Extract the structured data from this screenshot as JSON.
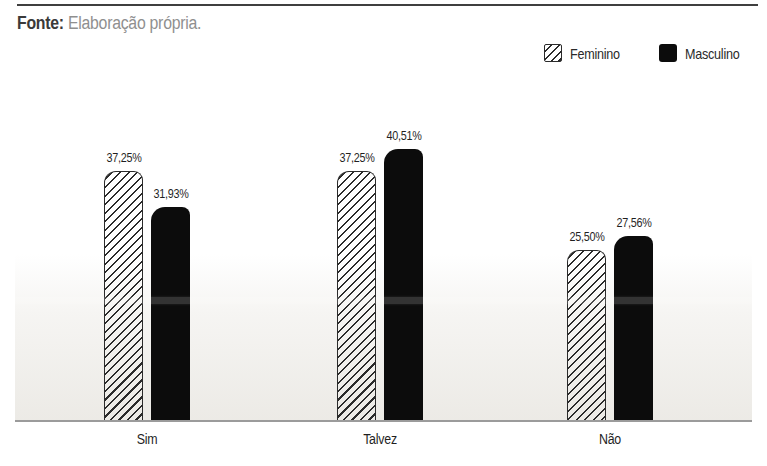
{
  "source_note": {
    "label": "Fonte:",
    "text": "Elaboração própria."
  },
  "legend": {
    "position": "top-right",
    "items": [
      {
        "label": "Feminino",
        "swatch": "hatched-square-icon"
      },
      {
        "label": "Masculino",
        "swatch": "solid-square-icon"
      }
    ]
  },
  "chart_data": {
    "type": "bar",
    "title": "",
    "xlabel": "",
    "ylabel": "",
    "categories": [
      "Sim",
      "Talvez",
      "Não"
    ],
    "series": [
      {
        "name": "Feminino",
        "style": "hatched",
        "values": [
          37.25,
          37.25,
          25.5
        ],
        "value_labels": [
          "37,25%",
          "37,25%",
          "25,50%"
        ]
      },
      {
        "name": "Masculino",
        "style": "solid",
        "values": [
          31.93,
          40.51,
          27.56
        ],
        "value_labels": [
          "31,93%",
          "40,51%",
          "27,56%"
        ]
      }
    ],
    "unit": "%",
    "decimal_separator": ",",
    "ylim": [
      0,
      45
    ],
    "grid": false,
    "y_axis_visible": false,
    "value_labels_shown": true,
    "legend_position": "top-right"
  },
  "colors": {
    "bar_solid": "#0c0c0c",
    "hatch_line": "#2b2b2b",
    "baseline": "#9b9b9b",
    "top_rule": "#3f3f3f",
    "source_label_text": "#3a3a3a",
    "source_body_text": "#8f8f8f",
    "label_text": "#1f1f1f",
    "background_fade": "#eae8e3"
  }
}
